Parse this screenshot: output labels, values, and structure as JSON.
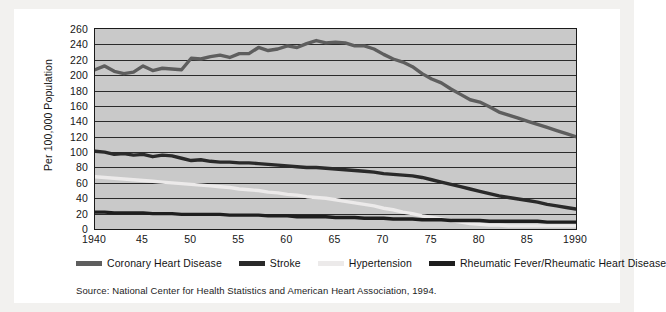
{
  "figure": {
    "source_note": "Source: National Center for Health Statistics and American Heart Association, 1994."
  },
  "colors": {
    "plot_background": "#c9c9c9",
    "gridline": "#2b2b2b",
    "coronary_heart_disease": "#5e5e5e",
    "stroke": "#2a2a2a",
    "hypertension": "#eceaea",
    "rheumatic_fever": "#1e1e1e"
  },
  "chart_data": {
    "type": "line",
    "title": "",
    "xlabel": "",
    "ylabel": "Per 100,000 Population",
    "xlim": [
      1940,
      1990
    ],
    "ylim": [
      0,
      260
    ],
    "ytick_step": 20,
    "grid": true,
    "legend_position": "bottom",
    "ytick_labels": [
      "260",
      "240",
      "220",
      "200",
      "180",
      "160",
      "140",
      "120",
      "100",
      "80",
      "60",
      "40",
      "20",
      "0"
    ],
    "yticks": [
      260,
      240,
      220,
      200,
      180,
      160,
      140,
      120,
      100,
      80,
      60,
      40,
      20,
      0
    ],
    "xtick_labels": [
      "1940",
      "45",
      "50",
      "55",
      "60",
      "65",
      "70",
      "75",
      "80",
      "85",
      "1990"
    ],
    "xticks": [
      1940,
      1945,
      1950,
      1955,
      1960,
      1965,
      1970,
      1975,
      1980,
      1985,
      1990
    ],
    "x": [
      1940,
      1941,
      1942,
      1943,
      1944,
      1945,
      1946,
      1947,
      1948,
      1949,
      1950,
      1951,
      1952,
      1953,
      1954,
      1955,
      1956,
      1957,
      1958,
      1959,
      1960,
      1961,
      1962,
      1963,
      1964,
      1965,
      1966,
      1967,
      1968,
      1969,
      1970,
      1971,
      1972,
      1973,
      1974,
      1975,
      1976,
      1977,
      1978,
      1979,
      1980,
      1981,
      1982,
      1983,
      1984,
      1985,
      1986,
      1987,
      1988,
      1989,
      1990
    ],
    "series": [
      {
        "name": "Coronary Heart Disease",
        "color": "#5e5e5e",
        "values": [
          207,
          212,
          205,
          202,
          204,
          212,
          206,
          209,
          208,
          207,
          222,
          221,
          224,
          226,
          223,
          228,
          228,
          236,
          232,
          234,
          238,
          236,
          241,
          245,
          242,
          243,
          242,
          238,
          238,
          234,
          227,
          221,
          217,
          211,
          202,
          195,
          190,
          182,
          175,
          168,
          165,
          159,
          152,
          148,
          144,
          140,
          136,
          132,
          128,
          124,
          120
        ]
      },
      {
        "name": "Stroke",
        "color": "#2a2a2a",
        "values": [
          101,
          100,
          97,
          98,
          96,
          97,
          94,
          96,
          95,
          92,
          89,
          90,
          88,
          87,
          87,
          86,
          86,
          85,
          84,
          83,
          82,
          81,
          80,
          80,
          79,
          78,
          77,
          76,
          75,
          74,
          72,
          71,
          70,
          69,
          67,
          64,
          61,
          58,
          55,
          52,
          49,
          46,
          43,
          41,
          39,
          37,
          35,
          32,
          30,
          28,
          26
        ]
      },
      {
        "name": "Hypertension",
        "color": "#eceaea",
        "values": [
          68,
          67,
          66,
          65,
          64,
          63,
          62,
          61,
          60,
          59,
          58,
          57,
          56,
          55,
          54,
          52,
          51,
          50,
          48,
          47,
          45,
          44,
          42,
          41,
          40,
          38,
          36,
          34,
          32,
          30,
          27,
          25,
          22,
          20,
          17,
          15,
          13,
          11,
          9,
          7,
          6,
          5,
          5,
          4,
          4,
          4,
          4,
          4,
          4,
          4,
          4
        ]
      },
      {
        "name": "Rheumatic Fever/Rheumatic Heart Disease",
        "color": "#1e1e1e",
        "values": [
          22,
          22,
          21,
          21,
          21,
          21,
          20,
          20,
          20,
          19,
          19,
          19,
          19,
          19,
          18,
          18,
          18,
          18,
          17,
          17,
          17,
          16,
          16,
          16,
          16,
          15,
          15,
          15,
          14,
          14,
          14,
          13,
          13,
          13,
          12,
          12,
          12,
          11,
          11,
          11,
          11,
          10,
          10,
          10,
          10,
          10,
          10,
          9,
          9,
          9,
          9
        ]
      }
    ]
  }
}
